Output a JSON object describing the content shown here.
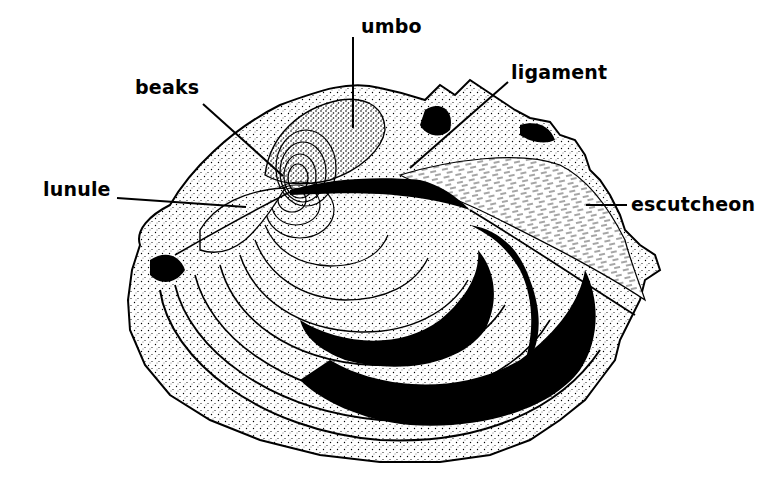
{
  "figure": {
    "style": "black-and-white stippled pen-and-ink illustration",
    "background": "#ffffff",
    "ink": "#000000"
  },
  "labels": [
    {
      "id": "umbo",
      "text": "umbo",
      "position": "top-center",
      "leader_from": [
        353,
        37
      ],
      "leader_to": [
        353,
        128
      ]
    },
    {
      "id": "beaks",
      "text": "beaks",
      "position": "upper-left",
      "leader_from": [
        203,
        104
      ],
      "leader_to": [
        283,
        176
      ]
    },
    {
      "id": "ligament",
      "text": "ligament",
      "position": "upper-right",
      "leader_from": [
        508,
        82
      ],
      "leader_to": [
        410,
        168
      ]
    },
    {
      "id": "lunule",
      "text": "lunule",
      "position": "left",
      "leader_from": [
        117,
        198
      ],
      "leader_to": [
        246,
        207
      ]
    },
    {
      "id": "escutcheon",
      "text": "escutcheon",
      "position": "right",
      "leader_from": [
        627,
        205
      ],
      "leader_to": [
        586,
        205
      ]
    }
  ]
}
